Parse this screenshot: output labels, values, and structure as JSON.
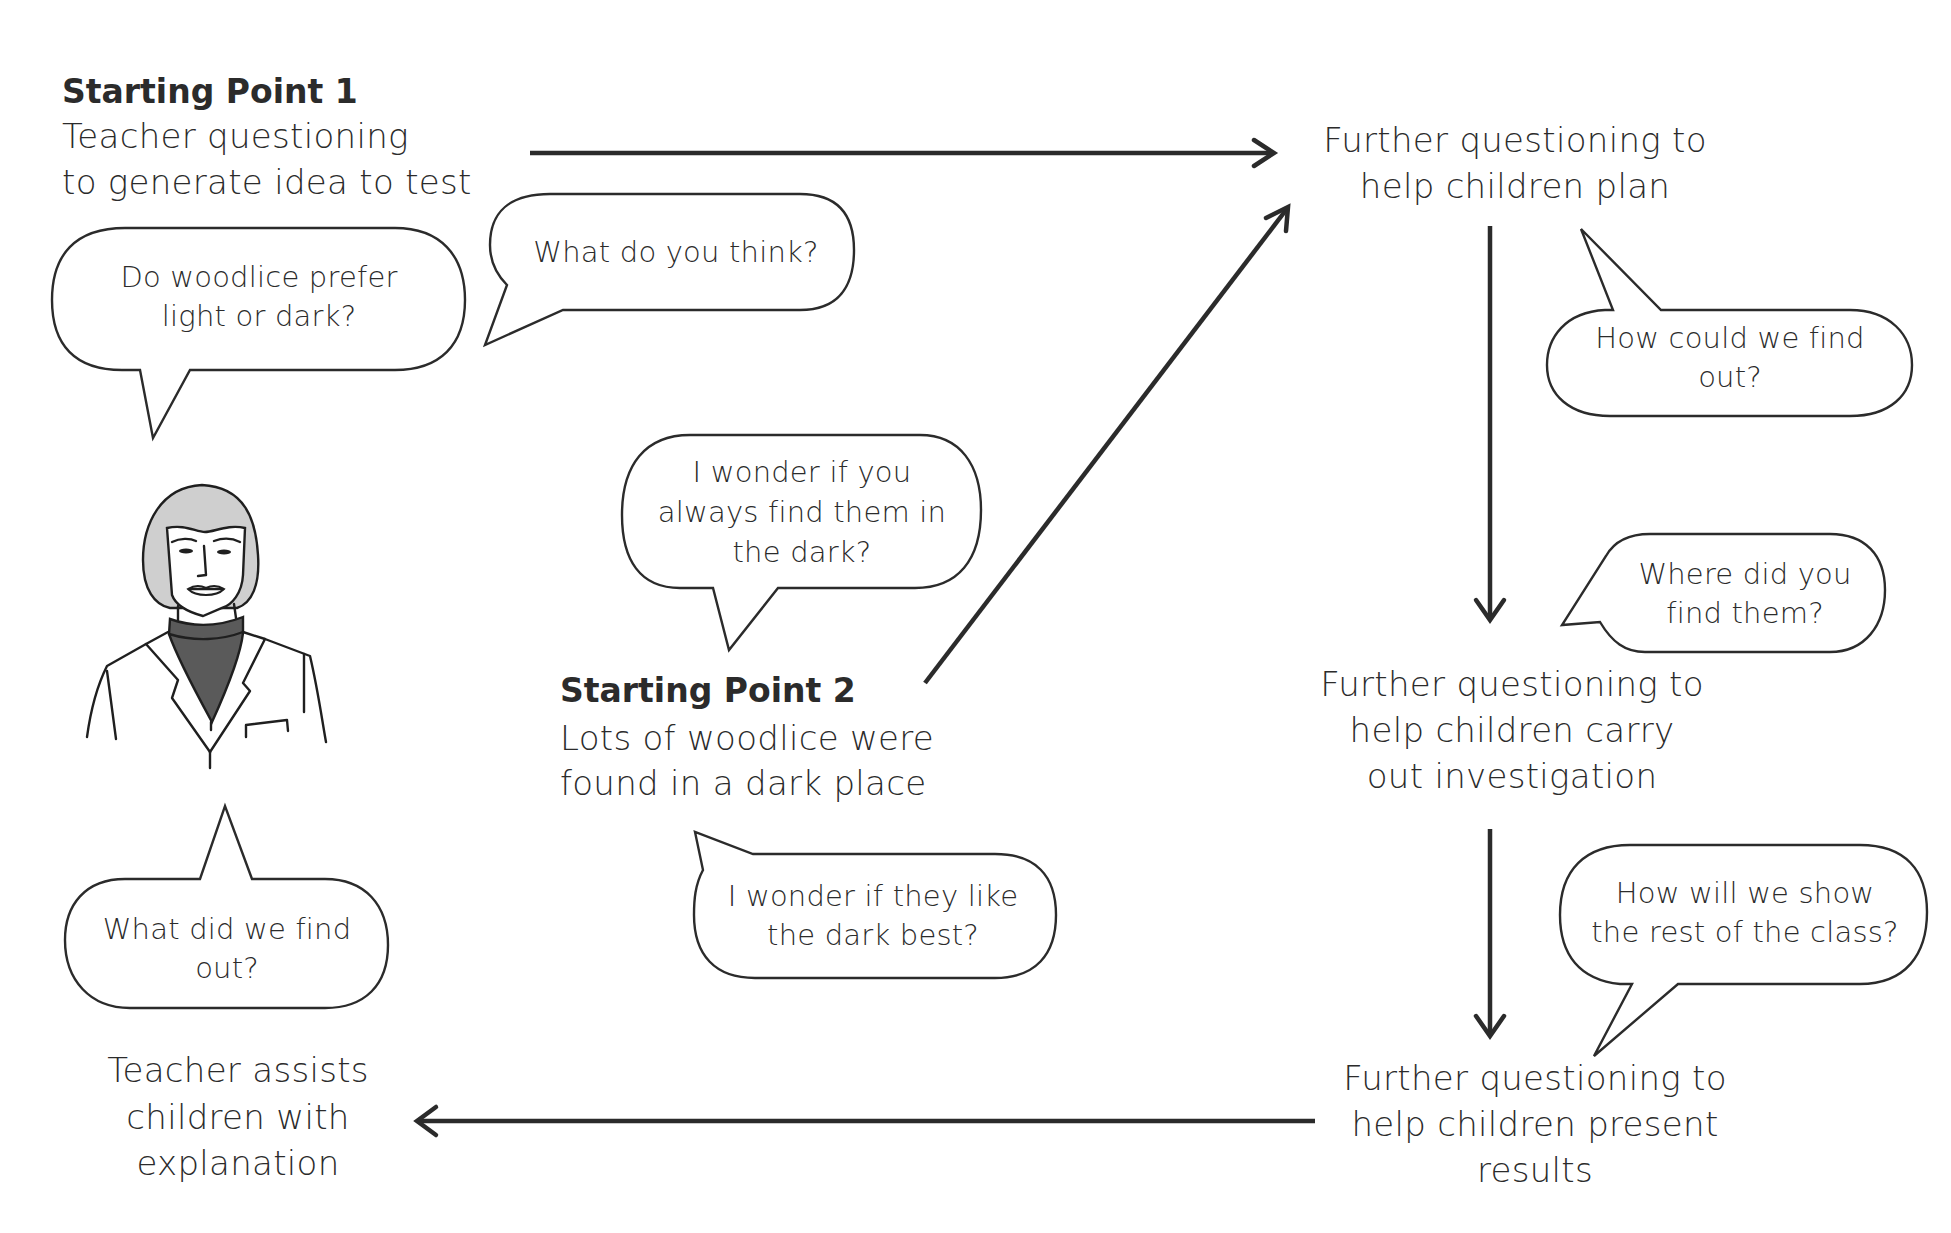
{
  "diagram": {
    "type": "flow-cycle",
    "colors": {
      "ink": "#2b2b2b",
      "hair": "#cfcfcf",
      "turtleneck": "#5a5a5a",
      "background": "#ffffff"
    },
    "starting_point_1": {
      "title": "Starting Point 1",
      "lines": [
        "Teacher questioning",
        "to generate idea to test"
      ]
    },
    "starting_point_2": {
      "title": "Starting Point 2",
      "lines": [
        "Lots of woodlice were",
        "found in a dark place"
      ]
    },
    "steps": {
      "plan": {
        "lines": [
          "Further questioning to",
          "help children plan"
        ]
      },
      "investigate": {
        "lines": [
          "Further questioning to",
          "help children carry",
          "out investigation"
        ]
      },
      "present": {
        "lines": [
          "Further questioning to",
          "help children present",
          "results"
        ]
      },
      "explain": {
        "lines": [
          "Teacher assists",
          "children with",
          "explanation"
        ]
      }
    },
    "bubbles": {
      "prefer": {
        "lines": [
          "Do woodlice prefer",
          "light or dark?"
        ]
      },
      "think": {
        "lines": [
          "What do you think?"
        ]
      },
      "wonder_always": {
        "lines": [
          "I wonder if you",
          "always find them in",
          "the dark?"
        ]
      },
      "wonder_like": {
        "lines": [
          "I wonder if they like",
          "the dark best?"
        ]
      },
      "find_out": {
        "lines": [
          "How could we find",
          "out?"
        ]
      },
      "where": {
        "lines": [
          "Where did you",
          "find them?"
        ]
      },
      "show": {
        "lines": [
          "How will we show",
          "the rest of the class?"
        ]
      },
      "what_found": {
        "lines": [
          "What did we find",
          "out?"
        ]
      }
    },
    "figure": {
      "icon": "teacher-illustration"
    },
    "arrows": [
      {
        "from": "starting_point_1",
        "to": "plan",
        "direction": "right"
      },
      {
        "from": "starting_point_2",
        "to": "plan",
        "direction": "up-right"
      },
      {
        "from": "plan",
        "to": "investigate",
        "direction": "down"
      },
      {
        "from": "investigate",
        "to": "present",
        "direction": "down"
      },
      {
        "from": "present",
        "to": "explain",
        "direction": "left"
      }
    ]
  }
}
